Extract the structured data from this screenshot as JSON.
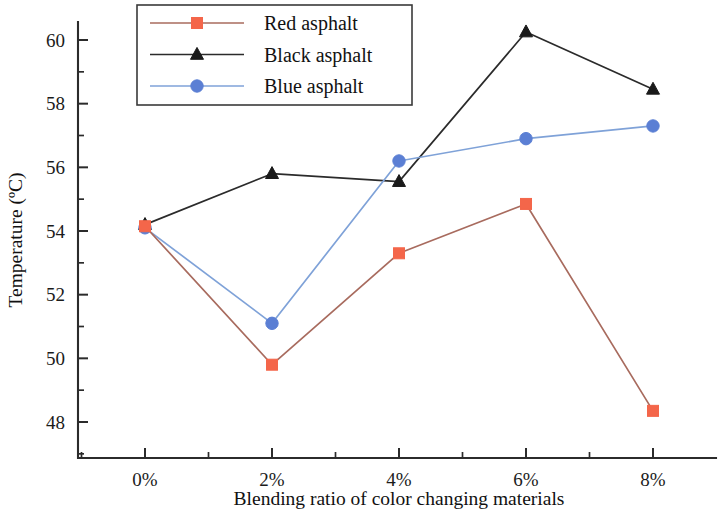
{
  "chart_data": {
    "type": "line",
    "title": "",
    "xlabel": "Blending ratio of color changing materials",
    "ylabel": "Temperature (ºC)",
    "categories": [
      "0%",
      "2%",
      "4%",
      "6%",
      "8%"
    ],
    "x": [
      0,
      2,
      4,
      6,
      8
    ],
    "xlim": [
      -0.85,
      9.1
    ],
    "ylim": [
      47.3,
      61.0
    ],
    "yticks": [
      48,
      50,
      52,
      54,
      56,
      58,
      60
    ],
    "ytick_labels": [
      "48",
      "50",
      "52",
      "54",
      "56",
      "58",
      "60"
    ],
    "xtick_labels": [
      "0%",
      "2%",
      "4%",
      "6%",
      "8%"
    ],
    "minor_ticks": true,
    "grid": false,
    "legend_position": "top-left",
    "series": [
      {
        "name": "Red asphalt",
        "color": "#F4664A",
        "line_color": "#A86B5E",
        "marker": "square",
        "values": [
          54.15,
          49.8,
          53.3,
          54.85,
          48.35
        ]
      },
      {
        "name": "Black asphalt",
        "color": "#1A1A1A",
        "line_color": "#2B2B2B",
        "marker": "triangle",
        "values": [
          54.2,
          55.8,
          55.55,
          60.25,
          58.45
        ]
      },
      {
        "name": "Blue asphalt",
        "color": "#5B7FD4",
        "line_color": "#7FA2D8",
        "marker": "circle",
        "values": [
          54.1,
          51.1,
          56.2,
          56.9,
          57.3
        ]
      }
    ]
  },
  "axes": {
    "y_title": "Temperature (ºC)",
    "x_title": "Blending ratio of color changing materials"
  },
  "legend": {
    "entries": [
      {
        "label": "Red asphalt"
      },
      {
        "label": "Black asphalt"
      },
      {
        "label": "Blue asphalt"
      }
    ]
  }
}
